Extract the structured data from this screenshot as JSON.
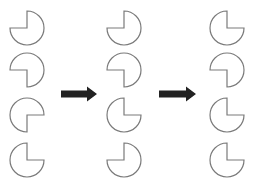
{
  "header": {
    "cropped_text": ""
  },
  "style": {
    "stroke": "#7a7a7a",
    "arrow_fill": "#222222",
    "radius": 17
  },
  "columns": [
    {
      "cx": 27,
      "shapes": [
        {
          "cy": 28,
          "missing": "top-left"
        },
        {
          "cy": 70,
          "missing": "bottom-left"
        },
        {
          "cy": 115,
          "missing": "bottom-right"
        },
        {
          "cy": 160,
          "missing": "top-right"
        }
      ]
    },
    {
      "cx": 124,
      "shapes": [
        {
          "cy": 28,
          "missing": "top-left"
        },
        {
          "cy": 70,
          "missing": "bottom-left"
        },
        {
          "cy": 115,
          "missing": "top-right"
        },
        {
          "cy": 160,
          "missing": "top-left"
        }
      ]
    },
    {
      "cx": 227,
      "shapes": [
        {
          "cy": 28,
          "missing": "top-right"
        },
        {
          "cy": 70,
          "missing": "bottom-left"
        },
        {
          "cy": 115,
          "missing": "top-right"
        },
        {
          "cy": 160,
          "missing": "top-right"
        }
      ]
    }
  ],
  "arrows": [
    {
      "x1": 61,
      "x2": 97,
      "y": 94
    },
    {
      "x1": 159,
      "x2": 196,
      "y": 94
    }
  ]
}
